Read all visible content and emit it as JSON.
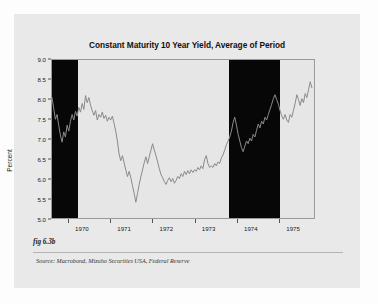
{
  "figure": {
    "fig_label": "fig 6.3b",
    "source_note": "Source:  Macrobond, Mizuho Securities USA, Federal Reserve",
    "card_bg": "#e9e9e9",
    "plot_bg": "#e6e6e6",
    "band_color": "#070707",
    "line_color": "#8a8a8a"
  },
  "chart_data": {
    "type": "line",
    "title": "Constant Maturity 10 Year Yield, Average of Period",
    "xlabel": "",
    "ylabel": "Percent",
    "ylim": [
      5.0,
      9.0
    ],
    "xlim": [
      1969.6,
      1975.85
    ],
    "grid": false,
    "legend": "none",
    "ytick_labels": [
      "9.0",
      "8.5",
      "8.0",
      "7.5",
      "7.0",
      "6.5",
      "6.0",
      "5.5",
      "5.0"
    ],
    "ytick_values": [
      9.0,
      8.5,
      8.0,
      7.5,
      7.0,
      6.5,
      6.0,
      5.5,
      5.0
    ],
    "xtick_labels": [
      "1970",
      "1971",
      "1972",
      "1973",
      "1974",
      "1975"
    ],
    "xtick_values": [
      1970,
      1971,
      1972,
      1973,
      1974,
      1975
    ],
    "shaded_regions": [
      {
        "label": "recession",
        "start": 1969.6,
        "end": 1970.22,
        "color": "#070707"
      },
      {
        "label": "recession",
        "start": 1973.8,
        "end": 1975.0,
        "color": "#070707"
      }
    ],
    "series": [
      {
        "name": "Constant Maturity 10 Year Yield",
        "color": "#8a8a8a",
        "x": [
          1969.6,
          1969.64,
          1969.68,
          1969.72,
          1969.76,
          1969.8,
          1969.84,
          1969.88,
          1969.92,
          1969.96,
          1970.0,
          1970.04,
          1970.08,
          1970.12,
          1970.16,
          1970.2,
          1970.24,
          1970.28,
          1970.32,
          1970.36,
          1970.4,
          1970.44,
          1970.48,
          1970.52,
          1970.56,
          1970.6,
          1970.64,
          1970.68,
          1970.72,
          1970.76,
          1970.8,
          1970.84,
          1970.88,
          1970.92,
          1970.96,
          1971.0,
          1971.04,
          1971.08,
          1971.12,
          1971.16,
          1971.2,
          1971.24,
          1971.28,
          1971.32,
          1971.36,
          1971.4,
          1971.44,
          1971.48,
          1971.52,
          1971.56,
          1971.6,
          1971.64,
          1971.68,
          1971.72,
          1971.76,
          1971.8,
          1971.84,
          1971.88,
          1971.92,
          1971.96,
          1972.0,
          1972.04,
          1972.08,
          1972.12,
          1972.16,
          1972.2,
          1972.24,
          1972.28,
          1972.32,
          1972.36,
          1972.4,
          1972.44,
          1972.48,
          1972.52,
          1972.56,
          1972.6,
          1972.64,
          1972.68,
          1972.72,
          1972.76,
          1972.8,
          1972.84,
          1972.88,
          1972.92,
          1972.96,
          1973.0,
          1973.04,
          1973.08,
          1973.12,
          1973.16,
          1973.2,
          1973.24,
          1973.28,
          1973.32,
          1973.36,
          1973.4,
          1973.44,
          1973.48,
          1973.52,
          1973.56,
          1973.6,
          1973.64,
          1973.68,
          1973.72,
          1973.76,
          1973.8,
          1973.84,
          1973.88,
          1973.92,
          1973.96,
          1974.0,
          1974.04,
          1974.08,
          1974.12,
          1974.16,
          1974.2,
          1974.24,
          1974.28,
          1974.32,
          1974.36,
          1974.4,
          1974.44,
          1974.48,
          1974.52,
          1974.56,
          1974.6,
          1974.64,
          1974.68,
          1974.72,
          1974.76,
          1974.8,
          1974.84,
          1974.88,
          1974.92,
          1974.96,
          1975.0,
          1975.04,
          1975.08,
          1975.12,
          1975.16,
          1975.2,
          1975.24,
          1975.28,
          1975.32,
          1975.36,
          1975.4,
          1975.44,
          1975.48,
          1975.52,
          1975.56,
          1975.6,
          1975.64,
          1975.68,
          1975.72,
          1975.76,
          1975.8
        ],
        "y": [
          8.05,
          7.78,
          7.5,
          7.62,
          7.35,
          7.1,
          6.92,
          7.18,
          7.05,
          7.35,
          7.2,
          7.45,
          7.62,
          7.48,
          7.7,
          7.58,
          7.8,
          7.68,
          7.9,
          7.75,
          8.1,
          7.92,
          8.05,
          7.85,
          7.72,
          7.6,
          7.72,
          7.48,
          7.62,
          7.55,
          7.68,
          7.52,
          7.6,
          7.45,
          7.55,
          7.48,
          7.58,
          7.4,
          7.2,
          6.95,
          6.62,
          6.45,
          6.58,
          6.4,
          6.22,
          6.05,
          6.18,
          6.02,
          5.82,
          5.62,
          5.4,
          5.62,
          5.85,
          6.05,
          6.22,
          6.4,
          6.55,
          6.38,
          6.55,
          6.72,
          6.88,
          6.72,
          6.58,
          6.42,
          6.25,
          6.1,
          6.02,
          5.92,
          5.85,
          5.95,
          6.02,
          5.92,
          6.0,
          5.88,
          5.95,
          6.05,
          6.0,
          6.12,
          6.05,
          6.18,
          6.1,
          6.2,
          6.12,
          6.22,
          6.15,
          6.22,
          6.18,
          6.28,
          6.22,
          6.32,
          6.25,
          6.48,
          6.58,
          6.38,
          6.28,
          6.32,
          6.28,
          6.38,
          6.32,
          6.42,
          6.38,
          6.52,
          6.6,
          6.72,
          6.85,
          6.95,
          7.05,
          7.2,
          7.42,
          7.55,
          7.35,
          7.12,
          6.95,
          6.78,
          6.68,
          6.82,
          6.95,
          6.88,
          7.02,
          6.95,
          7.12,
          7.05,
          7.22,
          7.38,
          7.28,
          7.45,
          7.38,
          7.55,
          7.48,
          7.62,
          7.75,
          7.88,
          8.02,
          8.12,
          8.0,
          7.88,
          7.72,
          7.58,
          7.5,
          7.62,
          7.48,
          7.42,
          7.62,
          7.55,
          7.72,
          7.9,
          8.12,
          8.0,
          7.85,
          8.02,
          7.92,
          8.15,
          8.05,
          8.25,
          8.45,
          8.3
        ],
        "min": 5.4,
        "max": 8.45,
        "start_value": 8.05,
        "end_value": 7.7
      }
    ]
  }
}
